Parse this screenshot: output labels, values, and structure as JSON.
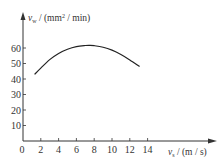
{
  "chart_data": {
    "type": "line",
    "title": "",
    "xlabel": "v_s / (m / s)",
    "ylabel": "v_w / (mm² / min)",
    "x_symbol": "v",
    "x_subscript": "s",
    "x_unit": " / (m / s)",
    "y_symbol": "v",
    "y_subscript": "w",
    "y_unit": " / (mm",
    "y_unit_sup": "2",
    "y_unit_tail": " / min)",
    "xlim": [
      0,
      15.5
    ],
    "ylim": [
      0,
      70
    ],
    "x_ticks": [
      "0",
      "2",
      "4",
      "6",
      "8",
      "10",
      "12",
      "14"
    ],
    "y_ticks": [
      "10",
      "20",
      "30",
      "40",
      "50",
      "60"
    ],
    "grid": false,
    "series": [
      {
        "name": "v_w",
        "x": [
          1.3,
          2,
          3,
          4,
          5,
          6,
          7,
          7.5,
          8,
          9,
          10,
          11,
          12,
          13.1
        ],
        "y": [
          43,
          47,
          52.5,
          56.5,
          59.2,
          60.9,
          61.6,
          61.7,
          61.5,
          60.5,
          58.6,
          55.8,
          52.3,
          48
        ]
      }
    ]
  }
}
